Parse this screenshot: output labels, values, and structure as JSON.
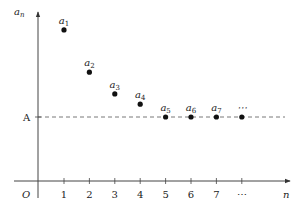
{
  "chart_data": {
    "type": "scatter",
    "title": "",
    "xlabel": "n",
    "ylabel": "a_n",
    "origin_label": "O",
    "x_tick_labels": [
      "1",
      "2",
      "3",
      "4",
      "5",
      "6",
      "7",
      "⋯"
    ],
    "reference_line": {
      "label": "A",
      "value": 1.0,
      "style": "dashed"
    },
    "series": [
      {
        "name": "a_n",
        "points": [
          {
            "label": "a",
            "sub": "1",
            "x": 1,
            "y": 2.36
          },
          {
            "label": "a",
            "sub": "2",
            "x": 2,
            "y": 1.7
          },
          {
            "label": "a",
            "sub": "3",
            "x": 3,
            "y": 1.36
          },
          {
            "label": "a",
            "sub": "4",
            "x": 4,
            "y": 1.2
          },
          {
            "label": "a",
            "sub": "5",
            "x": 5,
            "y": 1.0
          },
          {
            "label": "a",
            "sub": "6",
            "x": 6,
            "y": 1.0
          },
          {
            "label": "a",
            "sub": "7",
            "x": 7,
            "y": 1.0
          },
          {
            "label": "⋯",
            "sub": "",
            "x": 8,
            "y": 1.0
          }
        ]
      }
    ],
    "y_unit_note": "values relative to A (A = 1)",
    "grid": false,
    "legend": "none"
  }
}
